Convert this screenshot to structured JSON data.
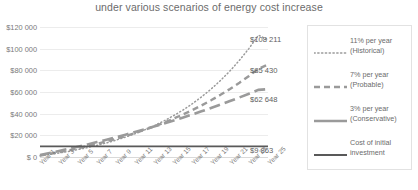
{
  "chart_data": {
    "type": "line",
    "title": "under various scenarios of energy cost increase",
    "xlabel": "",
    "ylabel": "",
    "ylim": [
      0,
      120000
    ],
    "ytick_values": [
      0,
      20000,
      40000,
      60000,
      80000,
      100000,
      120000
    ],
    "ytick_labels": [
      "$ 0",
      "$20 000",
      "$40 000",
      "$60 000",
      "$80 000",
      "$100 000",
      "$120 000"
    ],
    "grid": true,
    "legend_position": "right",
    "x": [
      1,
      2,
      3,
      4,
      5,
      6,
      7,
      8,
      9,
      10,
      11,
      12,
      13,
      14,
      15,
      16,
      17,
      18,
      19,
      20,
      21,
      22,
      23,
      24,
      25
    ],
    "xtick_labels": [
      "Year 1",
      "Year 3",
      "Year 5",
      "Year 7",
      "Year 9",
      "Year 11",
      "Year 13",
      "Year 15",
      "Year 17",
      "Year 19",
      "Year 21",
      "Year 23",
      "Year 25"
    ],
    "series": [
      {
        "name": "11% per year (Historical)",
        "style": "dotted",
        "color": "#9a9a9a",
        "end_label": "$108 211",
        "end_value": 108211,
        "values": [
          1100,
          2321,
          3676,
          5181,
          6851,
          8705,
          10762,
          13046,
          15581,
          18395,
          21518,
          24985,
          28834,
          33106,
          37848,
          43112,
          48955,
          55441,
          62640,
          70631,
          79500,
          89345,
          100273,
          112403,
          108211
        ]
      },
      {
        "name": "7% per year (Probable)",
        "style": "dashed",
        "color": "#9a9a9a",
        "end_label": "$85 430",
        "end_value": 85430,
        "values": [
          1400,
          2898,
          4501,
          6216,
          8051,
          10015,
          12116,
          14364,
          16770,
          19344,
          22098,
          25045,
          28198,
          31572,
          35182,
          39045,
          43178,
          47601,
          52333,
          57396,
          62814,
          68611,
          74813,
          81450,
          85430
        ]
      },
      {
        "name": "3% per year (Conservative)",
        "style": "solid-medium",
        "color": "#9a9a9a",
        "end_label": "$62 648",
        "end_value": 62648,
        "values": [
          1800,
          3654,
          5564,
          7530,
          9556,
          11643,
          13792,
          16006,
          18286,
          20635,
          23054,
          25545,
          28112,
          30755,
          33478,
          36282,
          39170,
          42145,
          45210,
          48366,
          51617,
          54966,
          58415,
          61967,
          62648
        ]
      },
      {
        "name": "Cost of initial investment",
        "style": "solid-thick",
        "color": "#595959",
        "end_label": "$9 863",
        "end_value": 9863,
        "values": [
          9863,
          9863,
          9863,
          9863,
          9863,
          9863,
          9863,
          9863,
          9863,
          9863,
          9863,
          9863,
          9863,
          9863,
          9863,
          9863,
          9863,
          9863,
          9863,
          9863,
          9863,
          9863,
          9863,
          9863,
          9863
        ]
      }
    ]
  },
  "legend": {
    "items": [
      {
        "line1": "11% per year",
        "line2": "(Historical)"
      },
      {
        "line1": "7% per year",
        "line2": "(Probable)"
      },
      {
        "line1": "3% per year",
        "line2": "(Conservative)"
      },
      {
        "line1": "Cost of initial",
        "line2": "investment"
      }
    ]
  }
}
